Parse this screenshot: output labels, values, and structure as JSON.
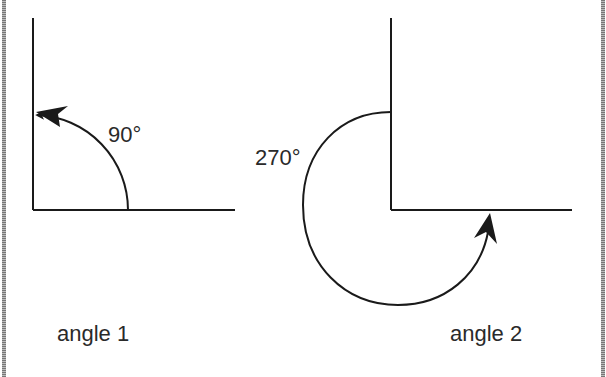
{
  "diagram": {
    "angles": [
      {
        "id": "angle-1",
        "measure_label": "90°",
        "caption": "angle 1",
        "degrees": 90
      },
      {
        "id": "angle-2",
        "measure_label": "270°",
        "caption": "angle 2",
        "degrees": 270
      }
    ],
    "colors": {
      "stroke": "#1a1a1a",
      "text": "#2a2a2a",
      "frame": "#888888"
    }
  }
}
